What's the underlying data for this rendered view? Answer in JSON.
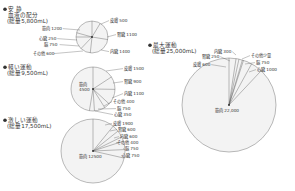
{
  "chart_data": [
    {
      "type": "pie",
      "title": "安 静",
      "subtitle": "血液の配分",
      "total_label": "(総量5,800mL)",
      "total": 5800,
      "center": [
        92,
        37
      ],
      "radius": 16,
      "slices": [
        {
          "name": "皮膚",
          "value": 500
        },
        {
          "name": "腎臓",
          "value": 1100
        },
        {
          "name": "内臓",
          "value": 1400
        },
        {
          "name": "その他",
          "value": 600
        },
        {
          "name": "脳",
          "value": 750
        },
        {
          "name": "心臓",
          "value": 250
        },
        {
          "name": "筋肉",
          "value": 1200
        }
      ],
      "labels": [
        {
          "text": "皮膚",
          "value": "500",
          "x": 110,
          "y": 22,
          "lx": 101,
          "ly": 24
        },
        {
          "text": "腎臓",
          "value": "1100",
          "x": 117,
          "y": 36,
          "lx": 107,
          "ly": 37
        },
        {
          "text": "内臓",
          "value": "1400",
          "x": 110,
          "y": 53,
          "lx": 101,
          "ly": 50
        },
        {
          "text": "筋肉",
          "value": "1200",
          "x": 42,
          "y": 30,
          "lx": 80,
          "ly": 30
        },
        {
          "text": "心臓",
          "value": "250",
          "x": 39,
          "y": 40,
          "lx": 77,
          "ly": 40
        },
        {
          "text": "脳",
          "value": "750",
          "x": 44,
          "y": 46,
          "lx": 79,
          "ly": 46
        },
        {
          "text": "その他",
          "value": "600",
          "x": 33,
          "y": 55,
          "lx": 83,
          "ly": 51
        }
      ]
    },
    {
      "type": "pie",
      "title": "軽い運動",
      "total_label": "(総量9,500mL)",
      "total": 9500,
      "center": [
        93,
        89
      ],
      "radius": 22,
      "center_label": {
        "name": "筋肉",
        "value": "4500"
      },
      "slices": [
        {
          "name": "皮膚",
          "value": 1500
        },
        {
          "name": "腎臓",
          "value": 900
        },
        {
          "name": "内臓",
          "value": 1100
        },
        {
          "name": "その他",
          "value": 400
        },
        {
          "name": "脳",
          "value": 750
        },
        {
          "name": "心臓",
          "value": 350
        },
        {
          "name": "筋肉",
          "value": 4500
        }
      ],
      "labels": [
        {
          "text": "皮膚",
          "value": "1500",
          "x": 124,
          "y": 70,
          "lx": 106,
          "ly": 71
        },
        {
          "text": "腎臓",
          "value": "900",
          "x": 124,
          "y": 83,
          "lx": 113,
          "ly": 83
        },
        {
          "text": "内臓",
          "value": "1100",
          "x": 124,
          "y": 95,
          "lx": 112,
          "ly": 98
        },
        {
          "text": "その他",
          "value": "400",
          "x": 113,
          "y": 103,
          "lx": 104,
          "ly": 106
        },
        {
          "text": "脳",
          "value": "750",
          "x": 117,
          "y": 110,
          "lx": 98,
          "ly": 109
        },
        {
          "text": "心臓",
          "value": "350",
          "x": 114,
          "y": 116,
          "lx": 95,
          "ly": 111
        }
      ]
    },
    {
      "type": "pie",
      "title": "激しい運動",
      "total_label": "(総量17,500mL)",
      "total": 17500,
      "center": [
        93,
        151
      ],
      "radius": 32,
      "center_label": {
        "name": "筋肉",
        "value": "12500"
      },
      "slices": [
        {
          "name": "皮膚",
          "value": 1900
        },
        {
          "name": "腎臓",
          "value": 600
        },
        {
          "name": "内臓",
          "value": 600
        },
        {
          "name": "その他",
          "value": 400
        },
        {
          "name": "脳",
          "value": 750
        },
        {
          "name": "心臓",
          "value": 750
        },
        {
          "name": "筋肉",
          "value": 12500
        }
      ],
      "labels": [
        {
          "text": "皮膚",
          "value": "1900",
          "x": 113,
          "y": 125,
          "lx": 105,
          "ly": 125
        },
        {
          "text": "腎臓",
          "value": "600",
          "x": 118,
          "y": 131,
          "lx": 110,
          "ly": 131
        },
        {
          "text": "内臓",
          "value": "600",
          "x": 120,
          "y": 138,
          "lx": 114,
          "ly": 138
        },
        {
          "text": "その他",
          "value": "400",
          "x": 117,
          "y": 144,
          "lx": 118,
          "ly": 143
        },
        {
          "text": "脳",
          "value": "750",
          "x": 125,
          "y": 150,
          "lx": 123,
          "ly": 149
        },
        {
          "text": "心臓",
          "value": "750",
          "x": 122,
          "y": 157,
          "lx": 123,
          "ly": 156
        }
      ]
    },
    {
      "type": "pie",
      "title": "最大運動",
      "total_label": "(総量25,000mL)",
      "total": 25000,
      "center": [
        229,
        105
      ],
      "radius": 47,
      "center_label": {
        "name": "筋肉",
        "value": "22,000"
      },
      "slices": [
        {
          "name": "皮膚",
          "value": 600
        },
        {
          "name": "腎臓",
          "value": 250
        },
        {
          "name": "内臓",
          "value": 300
        },
        {
          "name": "その他少量",
          "value": 100
        },
        {
          "name": "脳",
          "value": 750
        },
        {
          "name": "心臓",
          "value": 1000
        },
        {
          "name": "筋肉",
          "value": 22000
        }
      ],
      "labels": [
        {
          "text": "内臓",
          "value": "300",
          "x": 214,
          "y": 53,
          "lx": 236,
          "ly": 55
        },
        {
          "text": "腎臓",
          "value": "250",
          "x": 202,
          "y": 58,
          "lx": 230,
          "ly": 61
        },
        {
          "text": "皮膚",
          "value": "600",
          "x": 193,
          "y": 66,
          "lx": 226,
          "ly": 67
        },
        {
          "text": "その他少量",
          "value": "",
          "x": 251,
          "y": 57,
          "lx": 242,
          "ly": 59
        },
        {
          "text": "脳",
          "value": "750",
          "x": 256,
          "y": 64,
          "lx": 245,
          "ly": 64
        },
        {
          "text": "心臓",
          "value": "1000",
          "x": 257,
          "y": 71,
          "lx": 249,
          "ly": 72
        }
      ]
    }
  ]
}
